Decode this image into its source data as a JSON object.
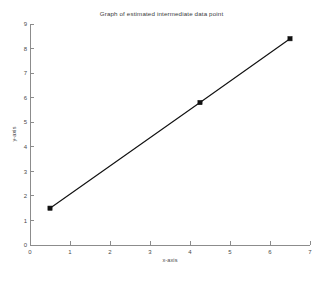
{
  "chart_data": {
    "type": "line",
    "title": "Graph of estimated intermediate data point",
    "xlabel": "x-axis",
    "ylabel": "y-axis",
    "xlim": [
      0,
      7
    ],
    "ylim": [
      0,
      9
    ],
    "xticks": [
      "0",
      "1",
      "2",
      "3",
      "4",
      "5",
      "6",
      "7"
    ],
    "yticks": [
      "0",
      "1",
      "2",
      "3",
      "4",
      "5",
      "6",
      "7",
      "8",
      "9"
    ],
    "grid": false,
    "legend": null,
    "series": [
      {
        "name": "estimated intermediate data point",
        "marker": "square",
        "color": "#111111",
        "x": [
          0.5,
          4.25,
          6.5
        ],
        "y": [
          1.5,
          5.8,
          8.4
        ],
        "points": [
          {
            "x": 0.5,
            "y": 1.5,
            "kind": "known"
          },
          {
            "x": 4.25,
            "y": 5.8,
            "kind": "estimated-intermediate"
          },
          {
            "x": 6.5,
            "y": 8.4,
            "kind": "known"
          }
        ]
      }
    ],
    "axis_color": "#8c8c8c",
    "text_color": "#4a4a4a",
    "background": "#ffffff"
  },
  "figure": {
    "width": 323,
    "height": 281
  }
}
